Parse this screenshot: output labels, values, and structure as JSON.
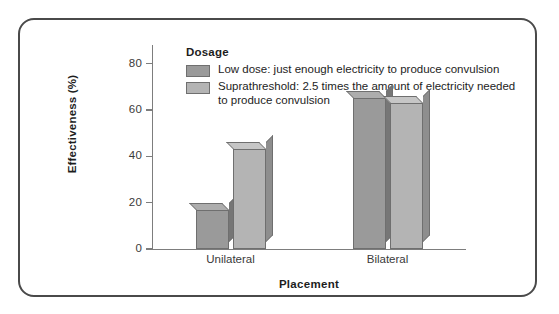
{
  "chart_data": {
    "type": "bar",
    "title": "",
    "xlabel": "Placement",
    "ylabel": "Effectiveness (%)",
    "categories": [
      "Unilateral",
      "Bilateral"
    ],
    "series": [
      {
        "name": "Low dose: just enough electricity to produce convulsion",
        "color": "#9a9a9a",
        "values": [
          17,
          65
        ]
      },
      {
        "name": "Suprathreshold: 2.5 times the amount of electricity needed to produce convulsion",
        "color": "#b4b4b4",
        "values": [
          43,
          63
        ]
      }
    ],
    "ylim": [
      0,
      88
    ],
    "yticks": [
      0,
      20,
      40,
      60,
      80
    ],
    "ytick_labels": [
      "0",
      "20",
      "40",
      "60",
      "80"
    ],
    "grid": false,
    "legend_position": "top-left-inside",
    "legend_title": "Dosage"
  },
  "legend": {
    "title": "Dosage",
    "entries": [
      {
        "label": "Low dose: just enough electricity to produce convulsion",
        "color": "#9a9a9a"
      },
      {
        "label": "Suprathreshold: 2.5 times the amount of electricity needed to produce convulsion",
        "color": "#b4b4b4"
      }
    ]
  },
  "axes": {
    "y_title": "Effectiveness (%)",
    "x_title": "Placement",
    "y_labels": [
      "80",
      "60",
      "40",
      "20",
      "0"
    ],
    "x_labels": [
      "Unilateral",
      "Bilateral"
    ]
  },
  "colors": {
    "frame": "#4a4a4a",
    "axis": "#7d7d7d",
    "bar_low_dose": "#9a9a9a",
    "bar_suprathreshold": "#b4b4b4",
    "bar_side_low_dose": "#767676",
    "bar_side_suprathreshold": "#8e8e8e",
    "text": "#1d1d1d",
    "background": "#ffffff"
  }
}
